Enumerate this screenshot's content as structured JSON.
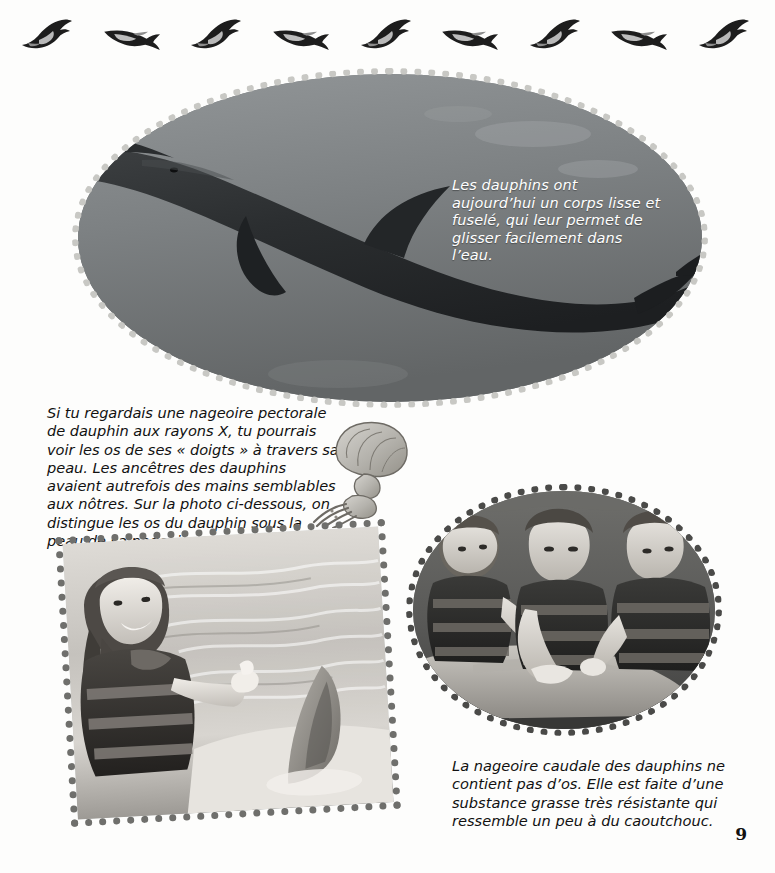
{
  "page": {
    "number": "9",
    "language": "fr",
    "background_color": "#fdfdfc"
  },
  "frieze": {
    "name": "dolphin-frieze",
    "count": 9,
    "icon": "dolphin-silhouette-icon",
    "color": "#222222"
  },
  "oval_photo": {
    "alt_name": "dolphin-underwater-photo",
    "border_style": "beaded-dotted",
    "border_color": "#c6c6c2",
    "water_color": "#7c8082",
    "caption": "Les dauphins ont aujourd’hui un corps lisse et fuselé, qui leur permet de glisser facilement dans l’eau.",
    "caption_color": "#ffffff"
  },
  "body_text": {
    "paragraph": "Si tu regardais une nageoire pectorale de dauphin aux rayons X, tu pourrais voir les os de ses « doigts » à travers sa peau. Les ancêtres des dauphins avaient autrefois des mains semblables aux nôtres. Sur la photo ci-dessous, on distingue les os du dauphin sous la peau de sa nageoire."
  },
  "flipper_drawing": {
    "name": "flipper-bone-xray-drawing",
    "description": "pectoral flipper skeleton with finger bones",
    "color": "#8c8c88"
  },
  "round_photo": {
    "alt_name": "children-touching-dolphin-photo",
    "border_style": "beaded-dotted",
    "border_color": "#4a4a48",
    "subjects": "three children in life vests touching a dolphin"
  },
  "girl_photo": {
    "alt_name": "girl-thumbs-up-with-dolphin-tail-photo",
    "border_style": "beaded-dotted",
    "border_color": "#6f6f6c",
    "rotation_deg": -3.2,
    "subjects": "girl with braids giving a thumbs up beside a dolphin tail fluke"
  },
  "bottom_caption": {
    "text": "La nageoire caudale des dauphins ne contient pas d’os. Elle est faite d’une substance grasse très résistante qui ressemble un peu à du caoutchouc."
  }
}
